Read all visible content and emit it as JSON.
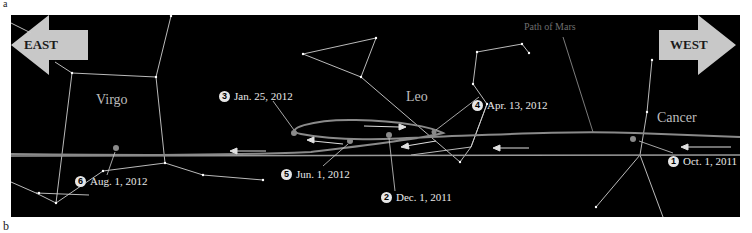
{
  "figure": {
    "panel_a_letter": "a",
    "panel_b_letter": "b"
  },
  "directions": {
    "east": "EAST",
    "west": "WEST"
  },
  "constellations": {
    "virgo": "Virgo",
    "leo": "Leo",
    "cancer": "Cancer"
  },
  "path_label": "Path of Mars",
  "positions": [
    {
      "number": "1",
      "date": "Oct. 1, 2011"
    },
    {
      "number": "2",
      "date": "Dec. 1, 2011"
    },
    {
      "number": "3",
      "date": "Jan. 25, 2012"
    },
    {
      "number": "4",
      "date": "Apr. 13, 2012"
    },
    {
      "number": "5",
      "date": "Jun. 1, 2012"
    },
    {
      "number": "6",
      "date": "Aug. 1, 2012"
    }
  ],
  "colors": {
    "background": "#000000",
    "constellation_lines": "#d0d0d0",
    "mars_path": "#8a8a8a",
    "arrow_fill": "#c8c8c8",
    "label_text": "#e8e8e8"
  }
}
